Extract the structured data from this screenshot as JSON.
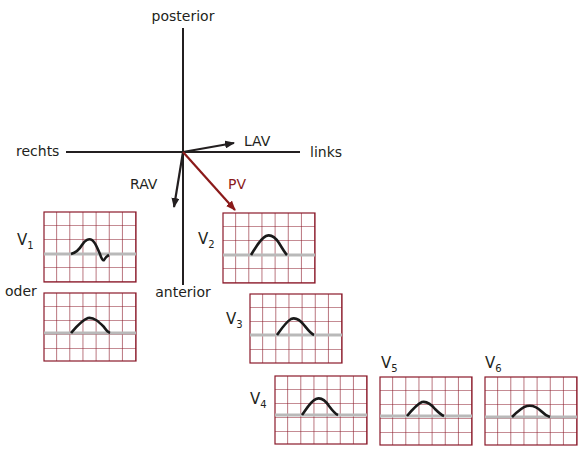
{
  "diagram": {
    "axes": {
      "top": "posterior",
      "bottom": "anterior",
      "left": "rechts",
      "right": "links"
    },
    "vectors": [
      {
        "id": "LAV",
        "label": "LAV",
        "color": "#231f20"
      },
      {
        "id": "RAV",
        "label": "RAV",
        "color": "#231f20"
      },
      {
        "id": "PV",
        "label": "PV",
        "color": "#8b1a1a"
      }
    ],
    "ecg_leads": [
      {
        "id": "V1",
        "name": "V",
        "sub": "1"
      },
      {
        "id": "V1-alt",
        "label": "oder"
      },
      {
        "id": "V2",
        "name": "V",
        "sub": "2"
      },
      {
        "id": "V3",
        "name": "V",
        "sub": "3"
      },
      {
        "id": "V4",
        "name": "V",
        "sub": "4"
      },
      {
        "id": "V5",
        "name": "V",
        "sub": "5"
      },
      {
        "id": "V6",
        "name": "V",
        "sub": "6"
      }
    ],
    "colors": {
      "grid": "#8b1a2a",
      "baseline": "#b9b9b9",
      "wave": "#1a1a1a",
      "axis": "#231f20",
      "pv_arrow": "#8b1a1a"
    }
  }
}
